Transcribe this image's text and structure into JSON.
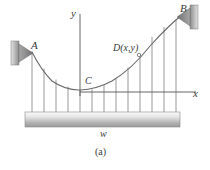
{
  "figure": {
    "caption": "(a)",
    "kind": "parabolic-cable-uniform-load-diagram"
  },
  "labels": {
    "point_a": "A",
    "point_b": "B",
    "point_c": "C",
    "point_d": "D(x,y)",
    "axis_y": "y",
    "axis_x": "x",
    "load": "w"
  },
  "colors": {
    "ink": "#3a3a3a",
    "curve": "#555555",
    "hanger": "#6b6b6b",
    "axis": "#555555",
    "support_fill_light": "#d9d9d9",
    "support_fill_dark": "#8f8f8f",
    "load_bar_light": "#f2f2f2",
    "load_bar_dark": "#9a9a9a",
    "background": "#ffffff"
  },
  "geometry": {
    "axis_origin": {
      "x": 80,
      "y": 92
    },
    "y_axis": {
      "x": 80,
      "top": 14,
      "bottom": 96
    },
    "x_axis": {
      "y": 92,
      "left": 80,
      "right": 196
    },
    "cable": {
      "point_a": {
        "x": 32,
        "y": 52
      },
      "point_c": {
        "x": 80,
        "y": 90
      },
      "point_b": {
        "x": 183,
        "y": 14
      },
      "point_d": {
        "x": 138,
        "y": 54
      }
    },
    "load_bar": {
      "x": 25,
      "y": 112,
      "width": 155,
      "height": 15
    },
    "hanger_count": 13,
    "hanger_x_positions": [
      32,
      44,
      56,
      68,
      80,
      92,
      104,
      116,
      128,
      140,
      152,
      164,
      176
    ],
    "support_left": {
      "x": 11,
      "y": 41,
      "width": 8,
      "height": 24
    },
    "support_right": {
      "x": 190,
      "y": 5,
      "width": 8,
      "height": 24
    }
  }
}
